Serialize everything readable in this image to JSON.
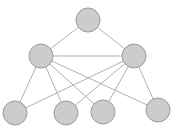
{
  "diagram": {
    "type": "graph",
    "colors": {
      "background": "#ffffff",
      "node_fill": "#cccccc",
      "node_stroke": "#9a9a9a",
      "edge": "#b0b0b0"
    },
    "node_radius": 12,
    "nodes": [
      {
        "id": "top",
        "x": 88,
        "y": 20
      },
      {
        "id": "mid-left",
        "x": 41,
        "y": 56
      },
      {
        "id": "mid-right",
        "x": 134,
        "y": 56
      },
      {
        "id": "bottom-1",
        "x": 15,
        "y": 113
      },
      {
        "id": "bottom-2",
        "x": 66,
        "y": 113
      },
      {
        "id": "bottom-3",
        "x": 103,
        "y": 112
      },
      {
        "id": "bottom-4",
        "x": 158,
        "y": 110
      }
    ],
    "edges": [
      [
        "top",
        "mid-left"
      ],
      [
        "top",
        "mid-right"
      ],
      [
        "mid-left",
        "mid-right"
      ],
      [
        "mid-left",
        "bottom-1"
      ],
      [
        "mid-left",
        "bottom-2"
      ],
      [
        "mid-left",
        "bottom-3"
      ],
      [
        "mid-left",
        "bottom-4"
      ],
      [
        "mid-right",
        "bottom-1"
      ],
      [
        "mid-right",
        "bottom-2"
      ],
      [
        "mid-right",
        "bottom-3"
      ],
      [
        "mid-right",
        "bottom-4"
      ]
    ]
  }
}
